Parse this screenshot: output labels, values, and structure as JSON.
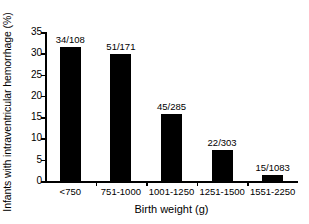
{
  "chart_data": {
    "type": "bar",
    "title": "",
    "xlabel": "Birth weight (g)",
    "ylabel": "Infants with intraventricular hemorrhage (%)",
    "categories": [
      "<750",
      "751-1000",
      "1001-1250",
      "1251-1500",
      "1551-2250"
    ],
    "values": [
      31.5,
      29.8,
      15.8,
      7.3,
      1.4
    ],
    "point_labels": [
      "34/108",
      "51/171",
      "45/285",
      "22/303",
      "15/1083"
    ],
    "ylim": [
      0,
      35
    ],
    "yticks": [
      0,
      5,
      10,
      15,
      20,
      25,
      30,
      35
    ],
    "ytick_labels": [
      "0",
      "5",
      "10",
      "15",
      "20",
      "25",
      "30",
      "35"
    ],
    "grid": false,
    "legend": "none",
    "bar_color": "#000000",
    "background_color": "#ffffff"
  }
}
